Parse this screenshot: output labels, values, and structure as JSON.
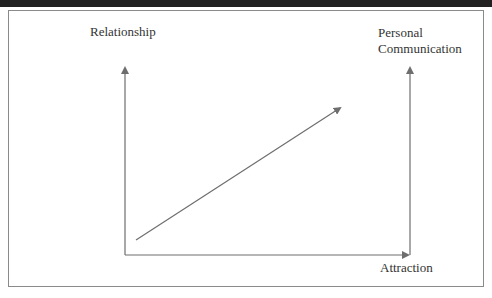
{
  "figure": {
    "labels": {
      "left_axis": "Relationship",
      "right_axis_line1": "Personal",
      "right_axis_line2": "Communication",
      "bottom_axis": "Attraction"
    },
    "colors": {
      "line": "#6e6e6e",
      "text": "#333333",
      "frame": "#8a8a8a",
      "top_band": "#222222"
    },
    "arrows": [
      {
        "name": "relationship-axis",
        "direction": "up"
      },
      {
        "name": "attraction-axis",
        "direction": "right"
      },
      {
        "name": "personal-communication-axis",
        "direction": "up"
      },
      {
        "name": "trend-arrow",
        "direction": "up-right"
      }
    ]
  }
}
